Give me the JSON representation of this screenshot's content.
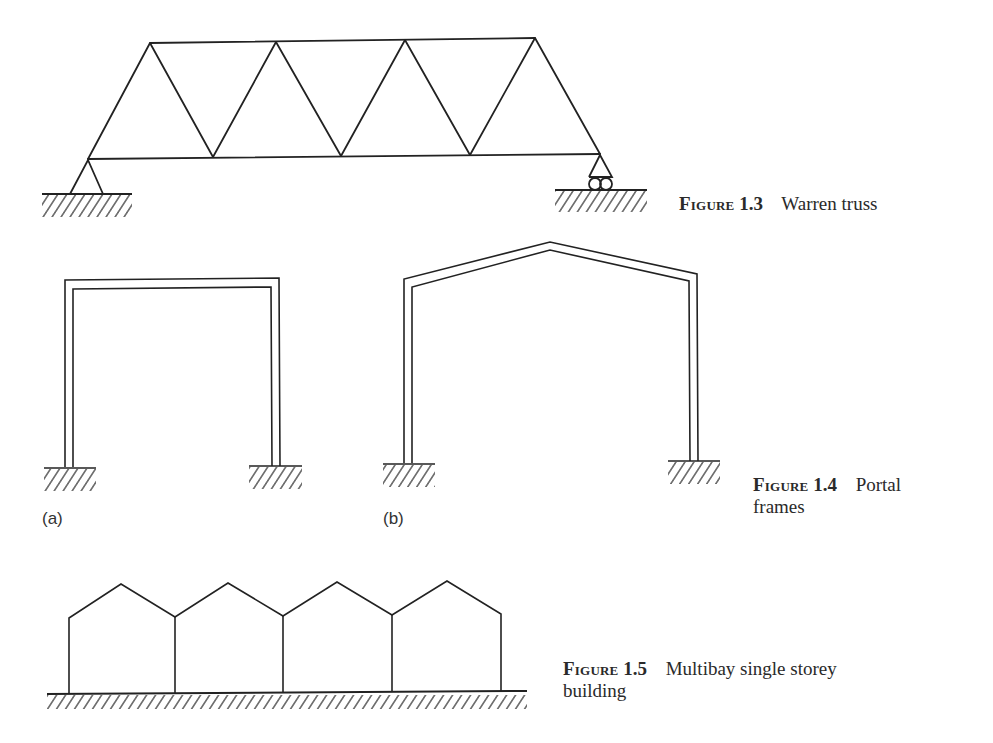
{
  "figures": [
    {
      "id": "fig-1-3",
      "label": "Figure",
      "number": "1.3",
      "title": "Warren truss",
      "supports": [
        "pin",
        "roller"
      ]
    },
    {
      "id": "fig-1-4",
      "label": "Figure",
      "number": "1.4",
      "title": "Portal",
      "title_line2": "frames",
      "sublabels": [
        "(a)",
        "(b)"
      ],
      "variants": [
        "flat-roof portal frame",
        "pitched-roof portal frame"
      ]
    },
    {
      "id": "fig-1-5",
      "label": "Figure",
      "number": "1.5",
      "title": "Multibay single storey",
      "title_line2": "building",
      "bays": 4
    }
  ],
  "colors": {
    "line": "#222222",
    "background": "#ffffff",
    "text": "#2a2a2a"
  }
}
